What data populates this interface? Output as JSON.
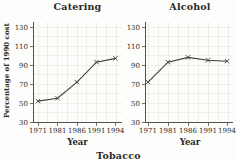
{
  "figure": {
    "third_chart_partial_title": "Tobacco"
  },
  "chart_data": [
    {
      "type": "line",
      "title": "Catering",
      "xlabel": "Year",
      "ylabel": "Percentage of 1990 cost",
      "categories": [
        "1971",
        "1981",
        "1986",
        "1991",
        "1994"
      ],
      "values": [
        52,
        55,
        72,
        93,
        97
      ],
      "ylim": [
        30,
        130
      ],
      "yticks": [
        30,
        50,
        70,
        90,
        110,
        130
      ],
      "grid": true,
      "marker": "x",
      "line_color": "#3f3d3a",
      "legend": "none"
    },
    {
      "type": "line",
      "title": "Alcohol",
      "xlabel": "Year",
      "ylabel": "",
      "categories": [
        "1971",
        "1981",
        "1986",
        "1991",
        "1994"
      ],
      "values": [
        72,
        93,
        98,
        95,
        94
      ],
      "ylim": [
        30,
        130
      ],
      "yticks": [
        30,
        50,
        70,
        90,
        110,
        130
      ],
      "grid": true,
      "marker": "x",
      "line_color": "#3f3d3a",
      "legend": "none"
    }
  ],
  "colors": {
    "background": "#fdfdfb",
    "grid": "#e4e4df",
    "axis": "#54524e",
    "text": "#2b2926"
  }
}
